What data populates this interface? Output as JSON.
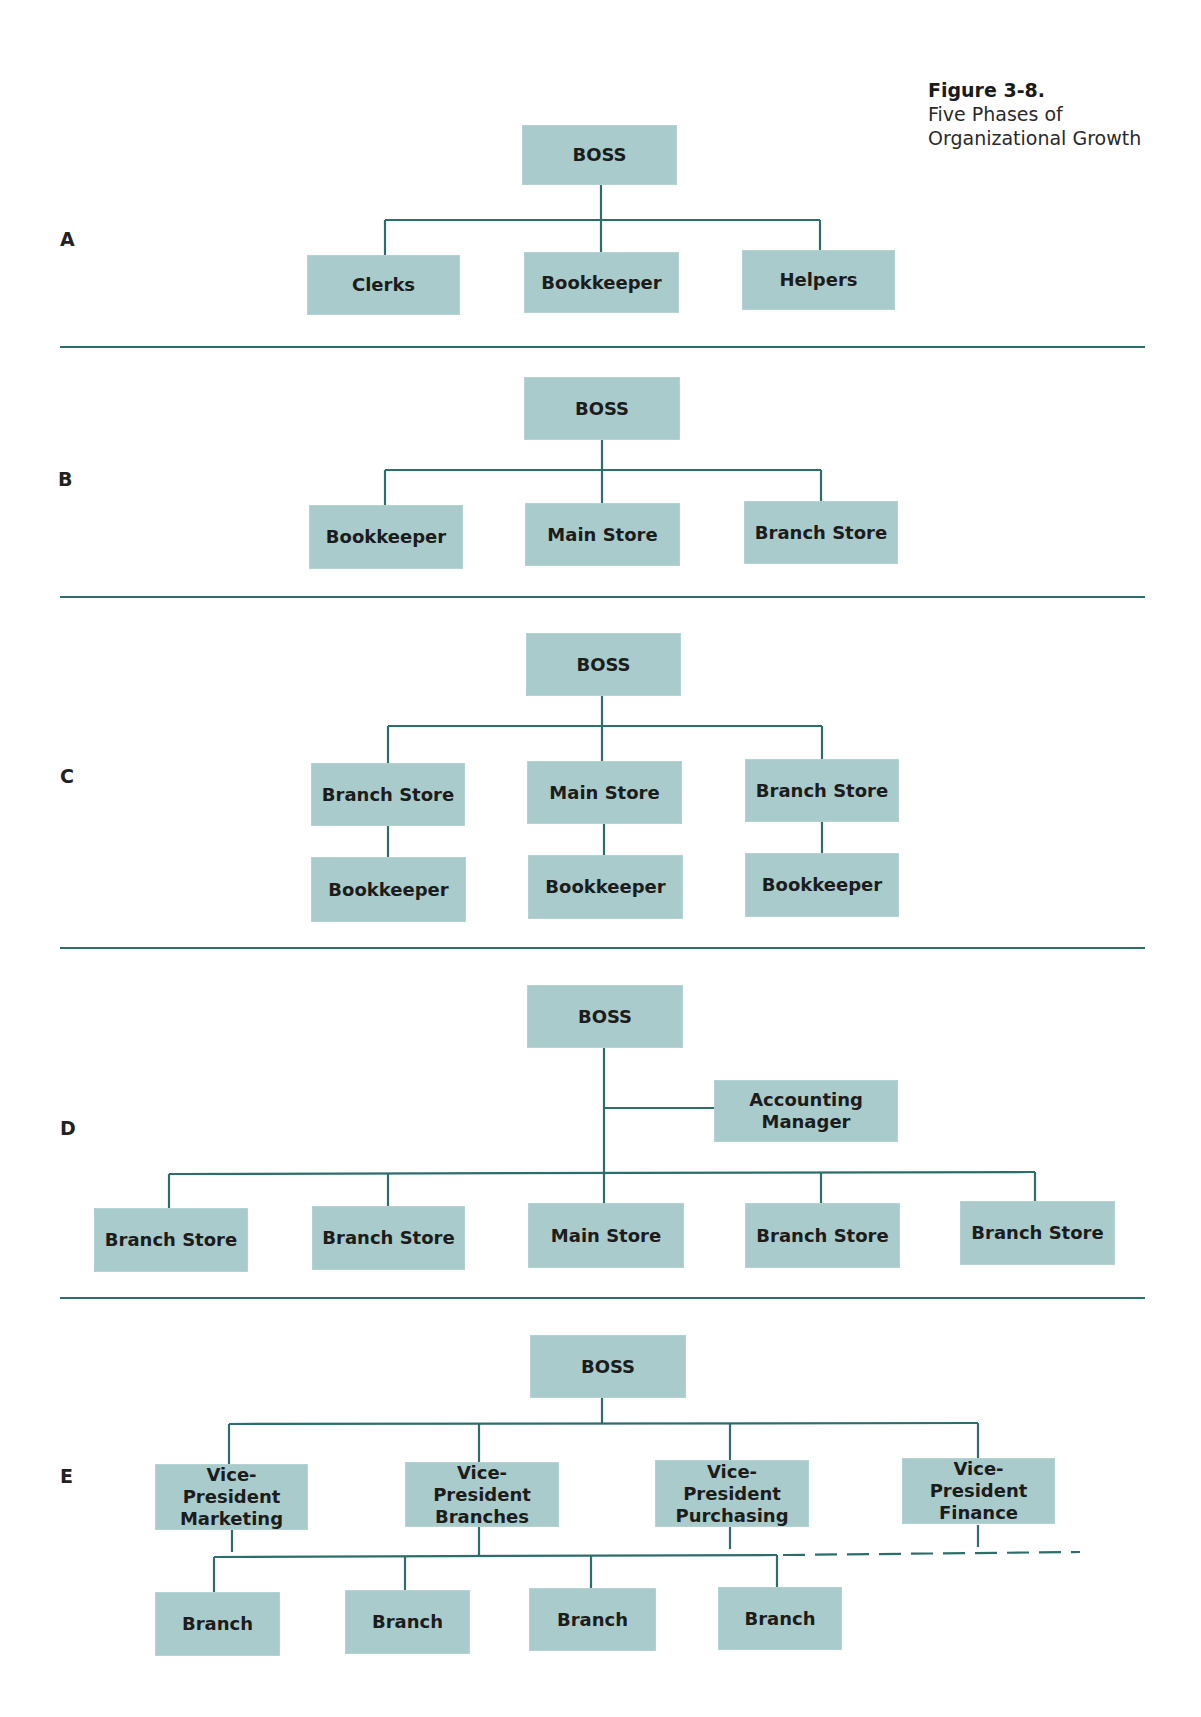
{
  "caption": {
    "figure": "Figure 3-8.",
    "line1": "Five Phases of",
    "line2": "Organizational Growth"
  },
  "colors": {
    "box": "#a9cbcb",
    "line": "#2e6e6a"
  },
  "sections": {
    "A": {
      "label": "A",
      "boss": "BOSS",
      "children": [
        "Clerks",
        "Bookkeeper",
        "Helpers"
      ]
    },
    "B": {
      "label": "B",
      "boss": "BOSS",
      "children": [
        "Bookkeeper",
        "Main Store",
        "Branch Store"
      ]
    },
    "C": {
      "label": "C",
      "boss": "BOSS",
      "stores": [
        "Branch Store",
        "Main Store",
        "Branch Store"
      ],
      "bookkeepers": [
        "Bookkeeper",
        "Bookkeeper",
        "Bookkeeper"
      ]
    },
    "D": {
      "label": "D",
      "boss": "BOSS",
      "staff": "Accounting Manager",
      "children": [
        "Branch Store",
        "Branch Store",
        "Main Store",
        "Branch Store",
        "Branch Store"
      ]
    },
    "E": {
      "label": "E",
      "boss": "BOSS",
      "vps": [
        "Vice-President Marketing",
        "Vice-President Branches",
        "Vice-President Purchasing",
        "Vice-President Finance"
      ],
      "branches": [
        "Branch",
        "Branch",
        "Branch",
        "Branch"
      ]
    }
  }
}
